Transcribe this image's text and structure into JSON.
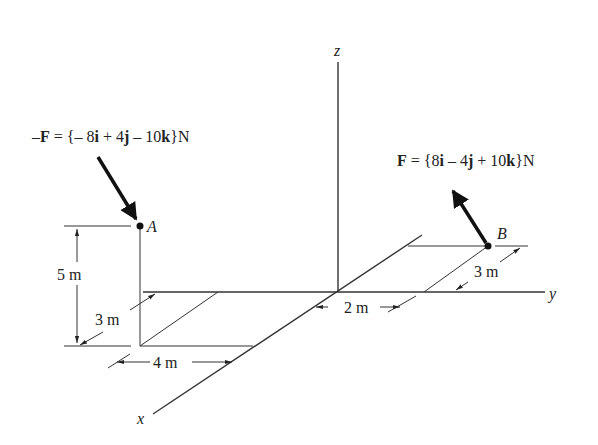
{
  "axes": {
    "x_label": "x",
    "y_label": "y",
    "z_label": "z"
  },
  "points": {
    "A": {
      "label": "A"
    },
    "B": {
      "label": "B"
    }
  },
  "forces": {
    "neg_F": {
      "prefix": "–",
      "symbol": "F",
      "eq": " = {– 8",
      "i": "i",
      "mid1": " + 4",
      "j": "j",
      "mid2": " – 10",
      "k": "k",
      "end": "}N"
    },
    "F": {
      "symbol": "F",
      "eq": " = {8",
      "i": "i",
      "mid1": " – 4",
      "j": "j",
      "mid2": " + 10",
      "k": "k",
      "end": "}N"
    }
  },
  "dimensions": {
    "A_height": "5 m",
    "A_depth": "3 m",
    "A_width": "4 m",
    "B_offset_y": "2 m",
    "B_depth": "3 m"
  }
}
